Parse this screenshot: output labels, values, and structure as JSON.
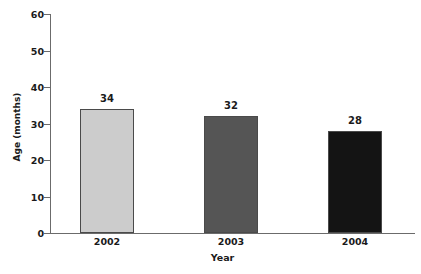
{
  "chart_data": {
    "type": "bar",
    "title": "",
    "subtitle": "",
    "xlabel": "Year",
    "ylabel": "Age (months)",
    "categories": [
      "2002",
      "2003",
      "2004"
    ],
    "values": [
      34,
      32,
      28
    ],
    "value_labels": [
      "34",
      "32",
      "28"
    ],
    "ylim": [
      0,
      60
    ],
    "yticks": [
      0,
      10,
      20,
      30,
      40,
      50,
      60
    ],
    "ytick_labels": [
      "0",
      "10",
      "20",
      "30",
      "40",
      "50",
      "60"
    ],
    "grid": false,
    "legend": false,
    "bar_colors": [
      "#cccccc",
      "#555555",
      "#141414"
    ],
    "bar_border_color": "#4a4a4a",
    "axis_color": "#6b6b6b",
    "background": "#ffffff",
    "text_color": "#1a1a1a"
  },
  "axes": {
    "y_title": "Age (months)",
    "x_title": "Year"
  },
  "ticks": {
    "y": [
      {
        "label": "60",
        "value": 60
      },
      {
        "label": "50",
        "value": 50
      },
      {
        "label": "40",
        "value": 40
      },
      {
        "label": "30",
        "value": 30
      },
      {
        "label": "20",
        "value": 20
      },
      {
        "label": "10",
        "value": 10
      },
      {
        "label": "0",
        "value": 0
      }
    ],
    "x": [
      {
        "label": "2002"
      },
      {
        "label": "2003"
      },
      {
        "label": "2004"
      }
    ]
  },
  "bars": [
    {
      "category": "2002",
      "value": 34,
      "label": "34",
      "color": "#cccccc"
    },
    {
      "category": "2003",
      "value": 32,
      "label": "32",
      "color": "#555555"
    },
    {
      "category": "2004",
      "value": 28,
      "label": "28",
      "color": "#141414"
    }
  ]
}
